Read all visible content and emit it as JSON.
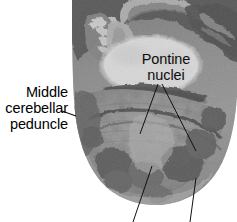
{
  "figure": {
    "type": "histology-photomicrograph",
    "background_color": "#ffffff",
    "photo": {
      "name": "stained brainstem section",
      "left": 72,
      "top": 0,
      "width": 165,
      "height": 210,
      "tone_dark": "#2b2b2b",
      "tone_mid": "#8d8d8d",
      "tone_light": "#d9d9d9",
      "tone_highlight": "#ffffff"
    },
    "annotations": [
      {
        "id": "middle-cerebellar-peduncle",
        "lines": [
          "Middle",
          "cerebellar",
          "peduncle"
        ],
        "text": "Middle cerebellar peduncle",
        "position": "left",
        "leader": "horizontal-dash-into-left-flank"
      },
      {
        "id": "pontine-nuclei",
        "lines": [
          "Pontine",
          "nuclei"
        ],
        "text": "Pontine nuclei",
        "position": "over-bright-basis-pontis",
        "leader": "two-lines-descending"
      }
    ],
    "unlabeled_leaders": [
      {
        "id": "bottom-leader-left",
        "exits": "bottom-edge",
        "x": 133
      },
      {
        "id": "bottom-leader-right",
        "exits": "bottom-edge",
        "x": 190
      }
    ],
    "label_color": "#000000",
    "leader_color": "#111111"
  }
}
